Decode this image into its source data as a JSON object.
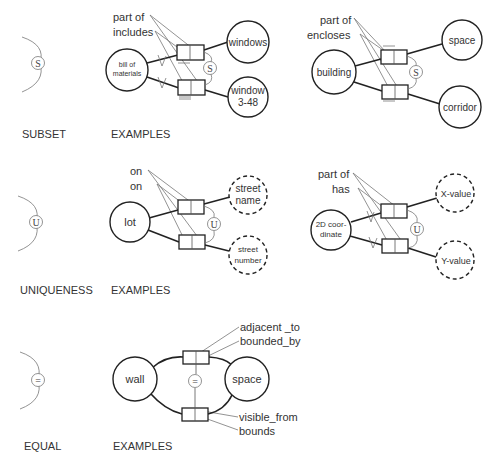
{
  "rows": [
    {
      "legend": {
        "symbol": "S",
        "caption": "SUBSET"
      },
      "examples_caption": "EXAMPLES",
      "example1": {
        "predicates": [
          "part of",
          "includes"
        ],
        "source": "bill of materials",
        "source_lines": [
          "bill of",
          "materials"
        ],
        "targets": [
          {
            "lines": [
              "windows"
            ],
            "dashed": false
          },
          {
            "lines": [
              "window",
              "3-48"
            ],
            "dashed": false
          }
        ],
        "constraint": "S"
      },
      "example2": {
        "predicates": [
          "part of",
          "encloses"
        ],
        "source_lines": [
          "building"
        ],
        "targets": [
          {
            "lines": [
              "space"
            ],
            "dashed": false
          },
          {
            "lines": [
              "corridor"
            ],
            "dashed": false
          }
        ],
        "constraint": "S"
      }
    },
    {
      "legend": {
        "symbol": "U",
        "caption": "UNIQUENESS"
      },
      "examples_caption": "EXAMPLES",
      "example1": {
        "predicates": [
          "on",
          "on"
        ],
        "source_lines": [
          "lot"
        ],
        "targets": [
          {
            "lines": [
              "street",
              "name"
            ],
            "dashed": true
          },
          {
            "lines": [
              "street",
              "number"
            ],
            "dashed": true
          }
        ],
        "constraint": "U"
      },
      "example2": {
        "predicates": [
          "part of",
          "has"
        ],
        "source_lines": [
          "2D coor-",
          "dinate"
        ],
        "targets": [
          {
            "lines": [
              "X-value"
            ],
            "dashed": true
          },
          {
            "lines": [
              "Y-value"
            ],
            "dashed": true
          }
        ],
        "constraint": "U"
      }
    },
    {
      "legend": {
        "symbol": "=",
        "caption": "EQUAL"
      },
      "examples_caption": "EXAMPLES",
      "example1": {
        "predicates_top": [
          "adjacent _to",
          "bounded_by"
        ],
        "predicates_bottom": [
          "visible_from",
          "bounds"
        ],
        "source_lines": [
          "wall"
        ],
        "target_lines": [
          "space"
        ],
        "constraint": "="
      }
    }
  ]
}
